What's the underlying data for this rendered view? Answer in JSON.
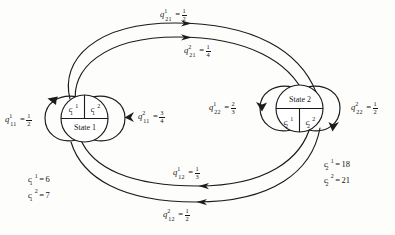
{
  "diagram": {
    "type": "state-transition-diagram",
    "background_color": "#fdfdfc",
    "stroke_color": "#1b1b1b",
    "nodes": [
      {
        "id": "state1",
        "label": "State 1",
        "label_position": "bottom",
        "cells": [
          {
            "base": "c",
            "sub": "1",
            "sup": "1"
          },
          {
            "base": "c",
            "sub": "1",
            "sup": "2"
          }
        ]
      },
      {
        "id": "state2",
        "label": "State 2",
        "label_position": "top",
        "cells": [
          {
            "base": "c",
            "sub": "2",
            "sup": "1"
          },
          {
            "base": "c",
            "sub": "2",
            "sup": "2"
          }
        ]
      }
    ],
    "self_loops": [
      {
        "id": "loop-state1-action1",
        "side": "left",
        "symbol": {
          "base": "q",
          "sup": "1",
          "sub": "11"
        },
        "value": {
          "num": "1",
          "den": "2"
        }
      },
      {
        "id": "loop-state1-action2",
        "side": "right",
        "symbol": {
          "base": "q",
          "sup": "2",
          "sub": "11"
        },
        "value": {
          "num": "3",
          "den": "4"
        }
      },
      {
        "id": "loop-state2-action1",
        "side": "left",
        "symbol": {
          "base": "q",
          "sup": "1",
          "sub": "22"
        },
        "value": {
          "num": "2",
          "den": "3"
        }
      },
      {
        "id": "loop-state2-action2",
        "side": "right",
        "symbol": {
          "base": "q",
          "sup": "2",
          "sub": "22"
        },
        "value": {
          "num": "1",
          "den": "2"
        }
      }
    ],
    "transitions": [
      {
        "id": "edge-1-to-2-action1",
        "from": "state1",
        "to": "state2",
        "route": "top-outer",
        "symbol": {
          "base": "q",
          "sup": "1",
          "sub": "21"
        },
        "value": {
          "num": "1",
          "den": "2"
        }
      },
      {
        "id": "edge-1-to-2-action2",
        "from": "state1",
        "to": "state2",
        "route": "top-inner",
        "symbol": {
          "base": "q",
          "sup": "2",
          "sub": "21"
        },
        "value": {
          "num": "1",
          "den": "4"
        }
      },
      {
        "id": "edge-2-to-1-action1",
        "from": "state2",
        "to": "state1",
        "route": "bottom-inner",
        "symbol": {
          "base": "q",
          "sup": "1",
          "sub": "12"
        },
        "value": {
          "num": "1",
          "den": "3"
        }
      },
      {
        "id": "edge-2-to-1-action2",
        "from": "state2",
        "to": "state1",
        "route": "bottom-outer",
        "symbol": {
          "base": "q",
          "sup": "2",
          "sub": "12"
        },
        "value": {
          "num": "1",
          "den": "2"
        }
      }
    ],
    "cost_blocks": [
      {
        "id": "costs-state1",
        "rows": [
          {
            "base": "c",
            "sub": "1",
            "sup": "1",
            "eq": "=",
            "value": "6"
          },
          {
            "base": "c",
            "sub": "1",
            "sup": "2",
            "eq": "=",
            "value": "7"
          }
        ]
      },
      {
        "id": "costs-state2",
        "rows": [
          {
            "base": "c",
            "sub": "2",
            "sup": "1",
            "eq": "=",
            "value": "18"
          },
          {
            "base": "c",
            "sub": "2",
            "sup": "2",
            "eq": "=",
            "value": "21"
          }
        ]
      }
    ]
  },
  "labels": {
    "state1_name": "State 1",
    "state2_name": "State 2",
    "c11_cell": "c",
    "c12_cell": "c",
    "c21_cell": "c",
    "c22_cell": "c",
    "equals": "=",
    "q_base": "q",
    "c_base": "c",
    "q11_1_sup": "1",
    "q11_1_sub": "11",
    "q11_1_num": "1",
    "q11_1_den": "2",
    "q11_2_sup": "2",
    "q11_2_sub": "11",
    "q11_2_num": "3",
    "q11_2_den": "4",
    "q22_1_sup": "1",
    "q22_1_sub": "22",
    "q22_1_num": "2",
    "q22_1_den": "3",
    "q22_2_sup": "2",
    "q22_2_sub": "22",
    "q22_2_num": "1",
    "q22_2_den": "2",
    "q21_1_sup": "1",
    "q21_1_sub": "21",
    "q21_1_num": "1",
    "q21_1_den": "2",
    "q21_2_sup": "2",
    "q21_2_sub": "21",
    "q21_2_num": "1",
    "q21_2_den": "4",
    "q12_1_sup": "1",
    "q12_1_sub": "12",
    "q12_1_num": "1",
    "q12_1_den": "3",
    "q12_2_sup": "2",
    "q12_2_sub": "12",
    "q12_2_num": "1",
    "q12_2_den": "2",
    "c1_sub": "1",
    "c2_sub": "2",
    "sup1": "1",
    "sup2": "2",
    "c1_1_value": "6",
    "c1_2_value": "7",
    "c2_1_value": "18",
    "c2_2_value": "21"
  }
}
